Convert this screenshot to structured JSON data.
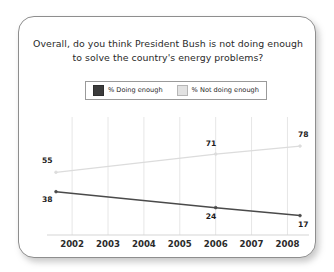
{
  "card": {
    "title_line_1": "Overall, do you think President Bush is not doing enough",
    "title_line_2": "to solve the country's energy problems?"
  },
  "legend": {
    "entries": [
      {
        "label": "% Doing enough",
        "swatch": "dark-swatch",
        "color": "#3c3c3c"
      },
      {
        "label": "% Not doing enough",
        "swatch": "light-swatch",
        "color": "#e2e2e2"
      }
    ]
  },
  "chart_data": {
    "type": "line",
    "title": "Overall, do you think President Bush is not doing enough to solve the country's energy problems?",
    "xlabel": "",
    "ylabel": "",
    "xlim": [
      2001.3,
      2008.6
    ],
    "ylim": [
      0,
      100
    ],
    "grid": true,
    "grid_axis": "x",
    "legend_position": "top-center",
    "categories": [
      "2002",
      "2003",
      "2004",
      "2005",
      "2006",
      "2007",
      "2008"
    ],
    "x_tick_labels": [
      "2002",
      "2003",
      "2004",
      "2005",
      "2006",
      "2007",
      "2008"
    ],
    "series": [
      {
        "name": "% Not doing enough",
        "color": "#dcdcdc",
        "x": [
          2001.55,
          2006.0,
          2008.35
        ],
        "values": [
          55,
          71,
          78
        ],
        "point_labels": [
          "55",
          "71",
          "78"
        ]
      },
      {
        "name": "% Doing enough",
        "color": "#4a4a4a",
        "x": [
          2001.55,
          2006.0,
          2008.35
        ],
        "values": [
          38,
          24,
          17
        ],
        "point_labels": [
          "38",
          "24",
          "17"
        ]
      }
    ]
  }
}
